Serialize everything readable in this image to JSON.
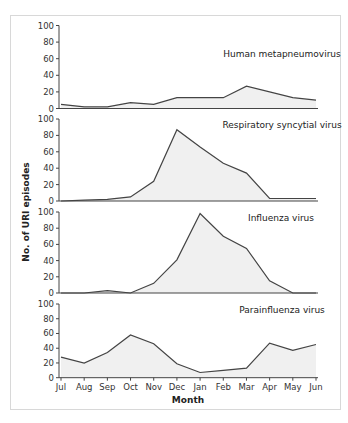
{
  "chart_data": {
    "type": "area",
    "title": "",
    "xlabel": "Month",
    "ylabel": "No. of URI episodes",
    "categories": [
      "Jul",
      "Aug",
      "Sep",
      "Oct",
      "Nov",
      "Dec",
      "Jan",
      "Feb",
      "Mar",
      "Apr",
      "May",
      "Jun"
    ],
    "ylim": [
      0,
      100
    ],
    "yticks": [
      0,
      20,
      40,
      60,
      80,
      100
    ],
    "grid": false,
    "legend": "none (panel titles inside each subplot)",
    "series": [
      {
        "name": "Human metapneumovirus",
        "values": [
          5,
          2,
          2,
          7,
          5,
          13,
          13,
          13,
          27,
          20,
          13,
          10
        ]
      },
      {
        "name": "Respiratory syncytial virus",
        "values": [
          0,
          1,
          2,
          5,
          24,
          87,
          66,
          46,
          34,
          3,
          3,
          3
        ]
      },
      {
        "name": "Influenza virus",
        "values": [
          0,
          0,
          3,
          0,
          12,
          41,
          98,
          70,
          55,
          15,
          0,
          0
        ]
      },
      {
        "name": "Parainfluenza virus",
        "values": [
          28,
          20,
          34,
          58,
          46,
          19,
          7,
          10,
          13,
          47,
          37,
          45
        ]
      }
    ]
  },
  "labels": {
    "xlabel": "Month",
    "ylabel": "No. of URI episodes",
    "panel_titles": [
      "Human metapneumovirus",
      "Respiratory syncytial virus",
      "Influenza virus",
      "Parainfluenza virus"
    ]
  },
  "colors": {
    "line": "#444444",
    "fill": "#f0f0f0",
    "border": "#d8d8d8"
  }
}
